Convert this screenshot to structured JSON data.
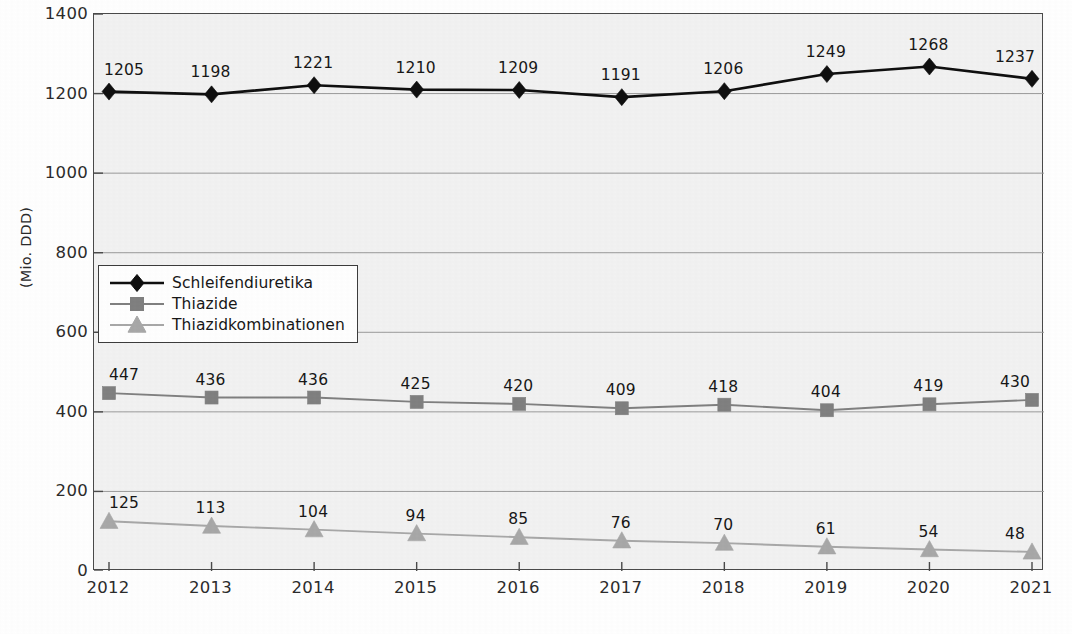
{
  "chart_data": {
    "type": "line",
    "title": "",
    "subtitle": "",
    "xlabel": "",
    "ylabel": "(Mio. DDD)",
    "categories": [
      "2012",
      "2013",
      "2014",
      "2015",
      "2016",
      "2017",
      "2018",
      "2019",
      "2020",
      "2021"
    ],
    "x": [
      2012,
      2013,
      2014,
      2015,
      2016,
      2017,
      2018,
      2019,
      2020,
      2021
    ],
    "ylim": [
      0,
      1400
    ],
    "yticks": [
      0,
      200,
      400,
      600,
      800,
      1000,
      1200,
      1400
    ],
    "ytick_labels": [
      "0",
      "200",
      "400",
      "600",
      "800",
      "1000",
      "1200",
      "1400"
    ],
    "grid": true,
    "grid_axis": "y",
    "legend_position": "inside-upper-left",
    "series": [
      {
        "name": "Schleifendiuretika",
        "color": "#0f0f0f",
        "marker": "diamond",
        "line_width": 2.6,
        "values": [
          1205,
          1198,
          1221,
          1210,
          1209,
          1191,
          1206,
          1249,
          1268,
          1237
        ],
        "data_labels": [
          "1205",
          "1198",
          "1221",
          "1210",
          "1209",
          "1191",
          "1206",
          "1249",
          "1268",
          "1237"
        ]
      },
      {
        "name": "Thiazide",
        "color": "#808080",
        "marker": "square",
        "line_width": 1.9,
        "values": [
          447,
          436,
          436,
          425,
          420,
          409,
          418,
          404,
          419,
          430
        ],
        "data_labels": [
          "447",
          "436",
          "436",
          "425",
          "420",
          "409",
          "418",
          "404",
          "419",
          "430"
        ]
      },
      {
        "name": "Thiazidkombinationen",
        "color": "#a8a8a8",
        "marker": "triangle",
        "line_width": 1.9,
        "values": [
          125,
          113,
          104,
          94,
          85,
          76,
          70,
          61,
          54,
          48
        ],
        "data_labels": [
          "125",
          "113",
          "104",
          "94",
          "85",
          "76",
          "70",
          "61",
          "54",
          "48"
        ]
      }
    ]
  },
  "legend": {
    "entries": [
      {
        "label": "Schleifendiuretika",
        "marker": "diamond-icon",
        "color": "#0f0f0f"
      },
      {
        "label": "Thiazide",
        "marker": "square-icon",
        "color": "#808080"
      },
      {
        "label": "Thiazidkombinationen",
        "marker": "triangle-icon",
        "color": "#a8a8a8"
      }
    ]
  },
  "caption": {
    "text": ""
  },
  "colors": {
    "plot_background": "#f2f2f2",
    "axis": "#4a4a4a",
    "gridline": "#9a9a9a",
    "series_1": "#0f0f0f",
    "series_2": "#808080",
    "series_3": "#a8a8a8"
  }
}
